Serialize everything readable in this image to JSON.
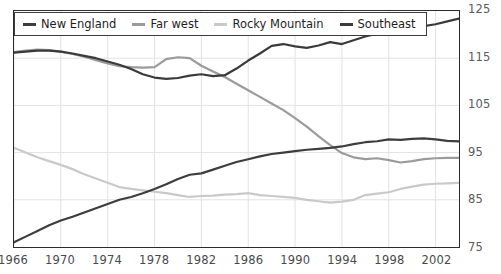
{
  "chart_data": {
    "type": "line",
    "title": "",
    "subtitle": "",
    "xlabel": "",
    "ylabel": "",
    "xlim": [
      1966,
      2004
    ],
    "ylim": [
      75,
      125
    ],
    "grid": true,
    "legend_position": "top-left",
    "x_ticks": [
      "1966",
      "1970",
      "1974",
      "1978",
      "1982",
      "1986",
      "1990",
      "1994",
      "1998",
      "2002"
    ],
    "x_tick_values": [
      1966,
      1970,
      1974,
      1978,
      1982,
      1986,
      1990,
      1994,
      1998,
      2002
    ],
    "y_ticks": [
      "125",
      "115",
      "105",
      "95",
      "85",
      "75"
    ],
    "y_tick_values": [
      125,
      115,
      105,
      95,
      85,
      75
    ],
    "x": [
      1966,
      1967,
      1968,
      1969,
      1970,
      1971,
      1972,
      1973,
      1974,
      1975,
      1976,
      1977,
      1978,
      1979,
      1980,
      1981,
      1982,
      1983,
      1984,
      1985,
      1986,
      1987,
      1988,
      1989,
      1990,
      1991,
      1992,
      1993,
      1994,
      1995,
      1996,
      1997,
      1998,
      1999,
      2000,
      2001,
      2002,
      2003,
      2004
    ],
    "series": [
      {
        "name": "New England",
        "color": "#3d3d3d",
        "values": [
          76.0,
          77.2,
          78.4,
          79.6,
          80.6,
          81.4,
          82.3,
          83.2,
          84.1,
          85.0,
          85.6,
          86.4,
          87.3,
          88.3,
          89.4,
          90.3,
          90.6,
          91.4,
          92.2,
          93.0,
          93.6,
          94.2,
          94.7,
          95.0,
          95.3,
          95.6,
          95.8,
          96.0,
          96.3,
          96.8,
          97.2,
          97.4,
          97.8,
          97.7,
          97.9,
          98.0,
          97.8,
          97.5,
          97.4
        ]
      },
      {
        "name": "Far west",
        "color": "#9b9b9b",
        "values": [
          116.3,
          116.6,
          116.8,
          116.7,
          116.4,
          115.9,
          115.3,
          114.6,
          113.9,
          113.3,
          113.1,
          113.0,
          113.1,
          114.8,
          115.2,
          115.0,
          113.4,
          112.2,
          111.0,
          109.6,
          108.2,
          106.8,
          105.4,
          104.0,
          102.3,
          100.5,
          98.5,
          96.6,
          94.9,
          94.0,
          93.6,
          93.8,
          93.4,
          92.9,
          93.2,
          93.6,
          93.8,
          93.9,
          93.9
        ]
      },
      {
        "name": "Rocky Mountain",
        "color": "#c9c9c9",
        "values": [
          96.0,
          95.0,
          94.0,
          93.2,
          92.4,
          91.5,
          90.4,
          89.5,
          88.6,
          87.7,
          87.3,
          87.0,
          86.7,
          86.4,
          86.0,
          85.6,
          85.8,
          85.9,
          86.1,
          86.2,
          86.4,
          86.0,
          85.8,
          85.6,
          85.4,
          85.0,
          84.7,
          84.4,
          84.6,
          85.0,
          86.0,
          86.3,
          86.6,
          87.3,
          87.8,
          88.2,
          88.4,
          88.5,
          88.6
        ]
      },
      {
        "name": "Southeast",
        "color": "#3a3a3a",
        "values": [
          116.2,
          116.4,
          116.6,
          116.6,
          116.4,
          116.0,
          115.5,
          115.0,
          114.3,
          113.6,
          112.7,
          111.6,
          110.9,
          110.6,
          110.8,
          111.3,
          111.6,
          111.2,
          111.4,
          112.8,
          114.5,
          116.0,
          117.6,
          118.0,
          117.5,
          117.2,
          117.7,
          118.4,
          118.0,
          118.8,
          119.6,
          120.2,
          120.0,
          120.6,
          121.2,
          121.8,
          122.2,
          122.8,
          123.4
        ]
      }
    ]
  },
  "legend": {
    "items": [
      {
        "label": "New England"
      },
      {
        "label": "Far west"
      },
      {
        "label": "Rocky Mountain"
      },
      {
        "label": "Southeast"
      }
    ]
  }
}
